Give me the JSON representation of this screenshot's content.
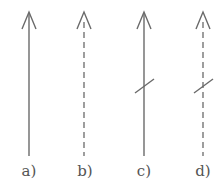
{
  "diagram": {
    "type": "arrow-variants",
    "stroke_color": "#6a6a6a",
    "label_color": "#555555",
    "arrows": [
      {
        "id": "a",
        "label": "a)",
        "x": 29,
        "style": "solid",
        "slash": false
      },
      {
        "id": "b",
        "label": "b)",
        "x": 84,
        "style": "dashed",
        "slash": false
      },
      {
        "id": "c",
        "label": "c)",
        "x": 144,
        "style": "solid",
        "slash": true
      },
      {
        "id": "d",
        "label": "d)",
        "x": 203,
        "style": "dashed",
        "slash": true
      }
    ]
  }
}
